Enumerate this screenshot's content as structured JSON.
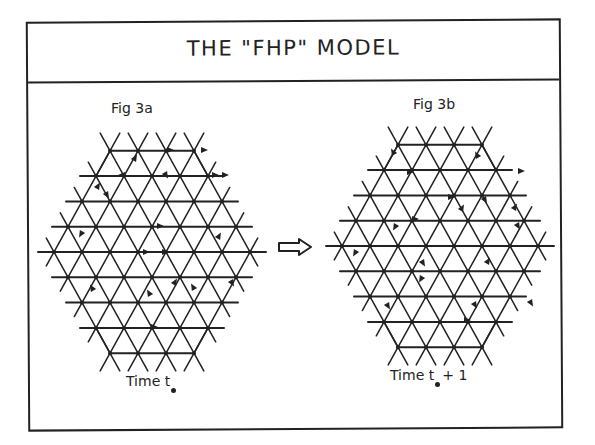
{
  "title": "THE \"FHP\" MODEL",
  "panels": [
    {
      "id": "fig3a",
      "label": "Fig 3a",
      "time_label": "Time  t",
      "time_suffix": "",
      "center": [
        152,
        252
      ],
      "particles": [
        [
          170,
          150,
          "e"
        ],
        [
          204,
          150,
          "e"
        ],
        [
          135,
          158,
          "ne"
        ],
        [
          122,
          175,
          "w"
        ],
        [
          98,
          186,
          "ne"
        ],
        [
          107,
          195,
          "se"
        ],
        [
          166,
          175,
          "se"
        ],
        [
          215,
          175,
          "e"
        ],
        [
          225,
          175,
          "e"
        ],
        [
          160,
          226,
          "e"
        ],
        [
          81,
          234,
          "sw"
        ],
        [
          219,
          236,
          "ne"
        ],
        [
          146,
          252,
          "e"
        ],
        [
          165,
          252,
          "e"
        ],
        [
          92,
          288,
          "nw"
        ],
        [
          149,
          293,
          "nw"
        ],
        [
          175,
          282,
          "ne"
        ],
        [
          193,
          287,
          "nw"
        ],
        [
          232,
          283,
          "se"
        ],
        [
          154,
          327,
          "e"
        ]
      ]
    },
    {
      "id": "fig3b",
      "label": "Fig 3b",
      "time_label": "Time  t",
      "time_suffix": "+ 1",
      "center": [
        440,
        246
      ],
      "particles": [
        [
          393,
          152,
          "nw"
        ],
        [
          410,
          172,
          "e"
        ],
        [
          477,
          155,
          "nw"
        ],
        [
          521,
          171,
          "e"
        ],
        [
          451,
          197,
          "e"
        ],
        [
          485,
          200,
          "se"
        ],
        [
          462,
          208,
          "ne"
        ],
        [
          415,
          219,
          "e"
        ],
        [
          515,
          207,
          "ne"
        ],
        [
          518,
          226,
          "se"
        ],
        [
          395,
          227,
          "sw"
        ],
        [
          355,
          253,
          "sw"
        ],
        [
          423,
          263,
          "se"
        ],
        [
          421,
          279,
          "sw"
        ],
        [
          488,
          261,
          "ne"
        ],
        [
          388,
          306,
          "se"
        ],
        [
          475,
          305,
          "se"
        ],
        [
          531,
          303,
          "se"
        ],
        [
          467,
          320,
          "e"
        ]
      ]
    }
  ],
  "transition_arrow": "right-hollow-arrow",
  "colors": {
    "ink": "#222222",
    "background": "#ffffff"
  }
}
